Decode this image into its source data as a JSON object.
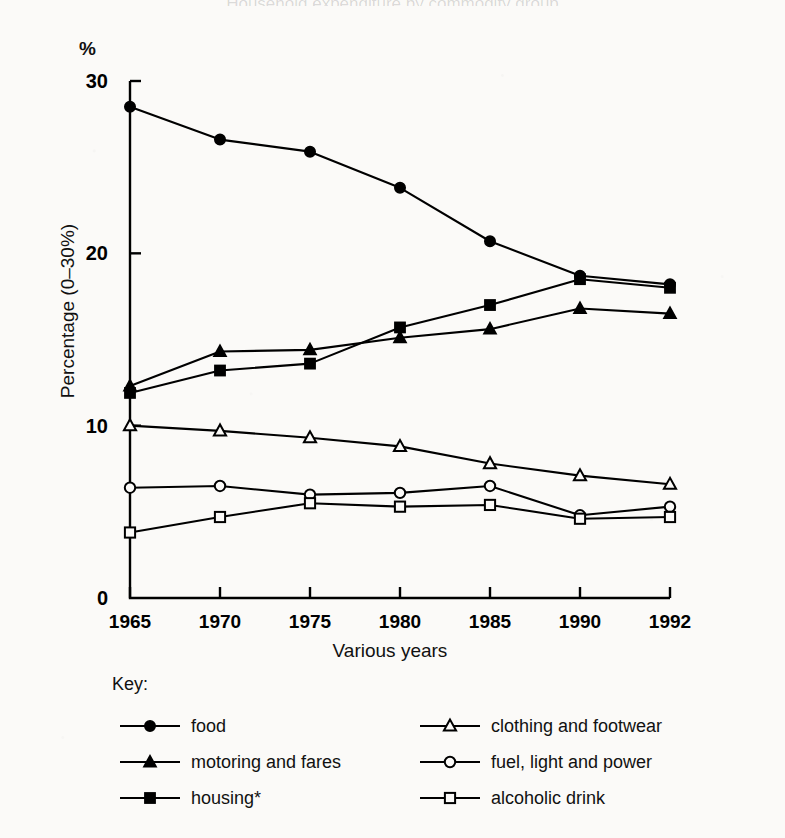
{
  "chart_data": {
    "type": "line",
    "title": "Household expenditure by commodity group",
    "unit_label": "%",
    "xlabel": "Various years",
    "ylabel": "Percentage (0–30%)",
    "categories": [
      "1965",
      "1970",
      "1975",
      "1980",
      "1985",
      "1990",
      "1992"
    ],
    "x": [
      1965,
      1970,
      1975,
      1980,
      1985,
      1990,
      1992
    ],
    "ylim": [
      0,
      30
    ],
    "yticks": [
      0,
      10,
      20,
      30
    ],
    "ytick_labels": [
      "0",
      "10",
      "20",
      "30"
    ],
    "grid": false,
    "legend_position": "below",
    "legend_title": "Key:",
    "series": [
      {
        "name": "food",
        "marker": "filled-circle",
        "values": [
          28.5,
          26.6,
          25.9,
          23.8,
          20.7,
          18.7,
          18.2
        ]
      },
      {
        "name": "motoring and fares",
        "marker": "filled-triangle",
        "values": [
          12.3,
          14.3,
          14.4,
          15.1,
          15.6,
          16.8,
          16.5
        ]
      },
      {
        "name": "housing*",
        "marker": "filled-square",
        "values": [
          11.9,
          13.2,
          13.6,
          15.7,
          17.0,
          18.5,
          18.0
        ]
      },
      {
        "name": "clothing and footwear",
        "marker": "open-triangle",
        "values": [
          10.0,
          9.7,
          9.3,
          8.8,
          7.8,
          7.1,
          6.6
        ]
      },
      {
        "name": "fuel, light and power",
        "marker": "open-circle",
        "values": [
          6.4,
          6.5,
          6.0,
          6.1,
          6.5,
          4.8,
          5.3
        ]
      },
      {
        "name": "alcoholic drink",
        "marker": "open-square",
        "values": [
          3.8,
          4.7,
          5.5,
          5.3,
          5.4,
          4.6,
          4.7
        ]
      }
    ]
  }
}
